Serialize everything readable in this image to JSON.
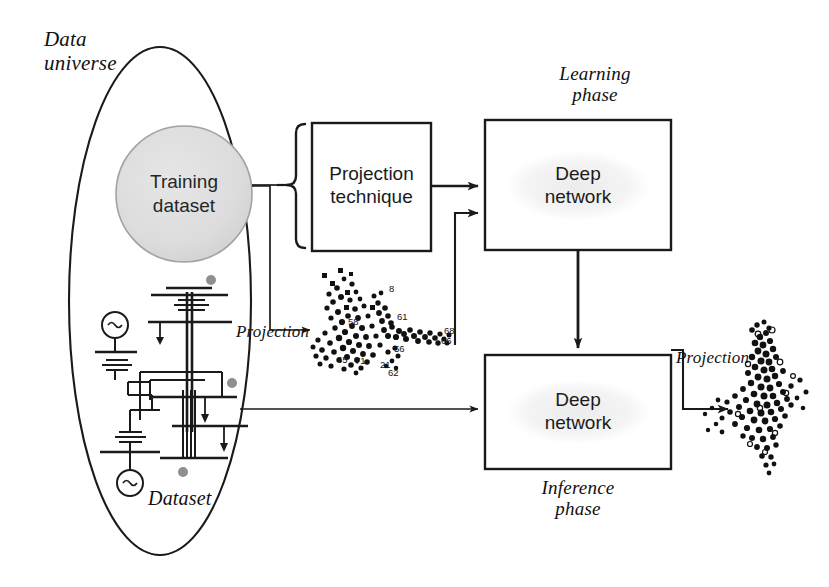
{
  "figure": {
    "type": "flow-diagram",
    "background": "#ffffff",
    "ink_color": "#1a1a1a"
  },
  "labels": {
    "data_universe": "Data\nuniverse",
    "learning_phase": "Learning\nphase",
    "inference_phase": "Inference\nphase",
    "dataset": "Dataset",
    "projection_left": "Projection",
    "projection_right": "Projection"
  },
  "nodes": {
    "training_dataset": {
      "label": "Training\ndataset",
      "shape": "circle",
      "fill": "#dcdcdc",
      "stroke": "#9a9a9a"
    },
    "projection_technique": {
      "label": "Projection\ntechnique",
      "shape": "rect",
      "fill": "#ffffff",
      "stroke": "#1a1a1a"
    },
    "deep_network_learning": {
      "label": "Deep\nnetwork",
      "shape": "rect",
      "fill": "#ffffff",
      "stroke": "#1a1a1a"
    },
    "deep_network_inference": {
      "label": "Deep\nnetwork",
      "shape": "rect",
      "fill": "#ffffff",
      "stroke": "#1a1a1a"
    }
  },
  "containers": {
    "data_universe_oval": {
      "shape": "ellipse",
      "stroke": "#1a1a1a",
      "fill": "none"
    },
    "brace": {
      "shape": "curly-brace-left",
      "stroke": "#1a1a1a"
    }
  },
  "edges": [
    {
      "name": "training-to-brace",
      "from": "training_dataset",
      "to": "projection_technique",
      "style": "elbow-plain"
    },
    {
      "name": "training-to-projection-scatter",
      "from": "training_dataset",
      "to": "scatter_left",
      "style": "elbow-arrow"
    },
    {
      "name": "projection-technique-to-deep-network",
      "from": "projection_technique",
      "to": "deep_network_learning",
      "style": "straight-arrow"
    },
    {
      "name": "scatter-left-to-deep-network",
      "from": "scatter_left",
      "to": "deep_network_learning",
      "style": "elbow-arrow"
    },
    {
      "name": "learning-to-inference",
      "from": "deep_network_learning",
      "to": "deep_network_inference",
      "style": "straight-arrow-down"
    },
    {
      "name": "dataset-to-inference",
      "from": "data_universe_oval",
      "to": "deep_network_inference",
      "style": "straight-arrow"
    },
    {
      "name": "inference-to-scatter-right",
      "from": "deep_network_inference",
      "to": "scatter_right",
      "style": "elbow-arrow"
    }
  ],
  "scatter_left": {
    "name": "projection-scatter-training",
    "marker_color": "#111111",
    "description": "dense 2D projection point cloud with numeric point labels",
    "visible_point_labels": [
      "8",
      "61",
      "68",
      "56",
      "58",
      "65",
      "71",
      "21",
      "2",
      "62",
      "66"
    ]
  },
  "scatter_right": {
    "name": "projection-scatter-inference",
    "marker_color": "#111111",
    "description": "dense 2D projection point cloud output by the inference network"
  },
  "circuit": {
    "name": "power-system-single-line-diagram",
    "description": "single-line electrical schematic with two AC sources, transformers, buses and load arrows",
    "stroke": "#1a1a1a",
    "source_symbol": "~",
    "accent_dot_color": "#8f8f8f"
  }
}
